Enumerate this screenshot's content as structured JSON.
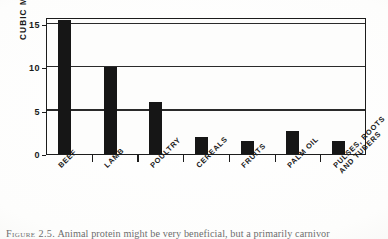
{
  "figure": {
    "caption_prefix": "Figure 2.5.",
    "caption_text": "Animal protein might be very beneficial, but a primarily carnivor",
    "background_color": "#fdfdfc",
    "ink_color": "#161616"
  },
  "chart_data": {
    "type": "bar",
    "title": "",
    "xlabel": "",
    "ylabel": "CUBIC METERS PER KILOGRAM",
    "categories": [
      "BEEF",
      "LAMB",
      "POULTRY",
      "CEREALS",
      "FRUITS",
      "PALM OIL",
      "PULSES, ROOTS AND TUBERS"
    ],
    "category_lines": [
      [
        "BEEF"
      ],
      [
        "LAMB"
      ],
      [
        "POULTRY"
      ],
      [
        "CEREALS"
      ],
      [
        "FRUITS"
      ],
      [
        "PALM OIL"
      ],
      [
        "PULSES, ROOTS",
        "AND TUBERS"
      ]
    ],
    "values": [
      15.4,
      10.0,
      6.0,
      2.0,
      1.5,
      2.6,
      1.5
    ],
    "ylim": [
      0,
      15.8
    ],
    "yticks": [
      0,
      5,
      10,
      15
    ],
    "ytick_labels": [
      "0",
      "5",
      "10",
      "15"
    ],
    "grid": true,
    "legend": false,
    "bar_color": "#161616"
  }
}
